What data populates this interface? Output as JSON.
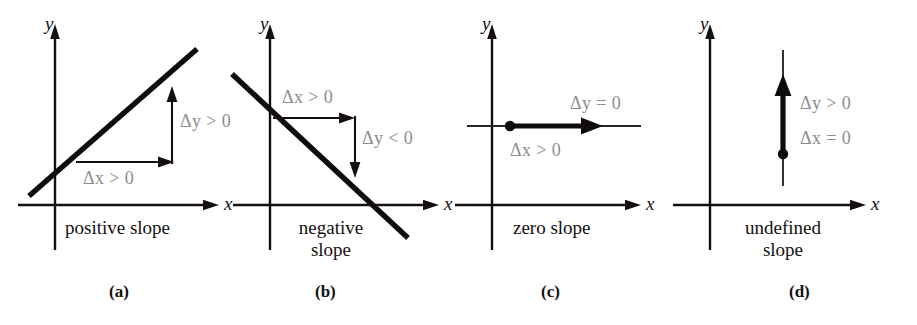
{
  "figure": {
    "width": 917,
    "height": 325,
    "background": "#ffffff",
    "axis_color": "#15100f",
    "line_color": "#100c0b",
    "annotation_color": "#8d8d8d"
  },
  "panels": [
    {
      "letter": "(a)",
      "caption": "positive  slope",
      "axis_x_label": "x",
      "axis_y_label": "y",
      "delta_y_label": "Δy > 0",
      "delta_x_label": "Δx > 0",
      "slope_type": "positive"
    },
    {
      "letter": "(b)",
      "caption": "negative\nslope",
      "caption_line1": "negative",
      "caption_line2": "slope",
      "axis_x_label": "x",
      "axis_y_label": "y",
      "delta_y_label": "Δy < 0",
      "delta_x_label": "Δx > 0",
      "slope_type": "negative"
    },
    {
      "letter": "(c)",
      "caption": "zero slope",
      "axis_x_label": "x",
      "axis_y_label": "y",
      "delta_y_label": "Δy = 0",
      "delta_x_label": "Δx > 0",
      "slope_type": "zero"
    },
    {
      "letter": "(d)",
      "caption": "undefined\nslope",
      "caption_line1": "undefined",
      "caption_line2": "slope",
      "axis_x_label": "x",
      "axis_y_label": "y",
      "delta_y_label": "Δy > 0",
      "delta_x_label": "Δx = 0",
      "slope_type": "undefined"
    }
  ]
}
